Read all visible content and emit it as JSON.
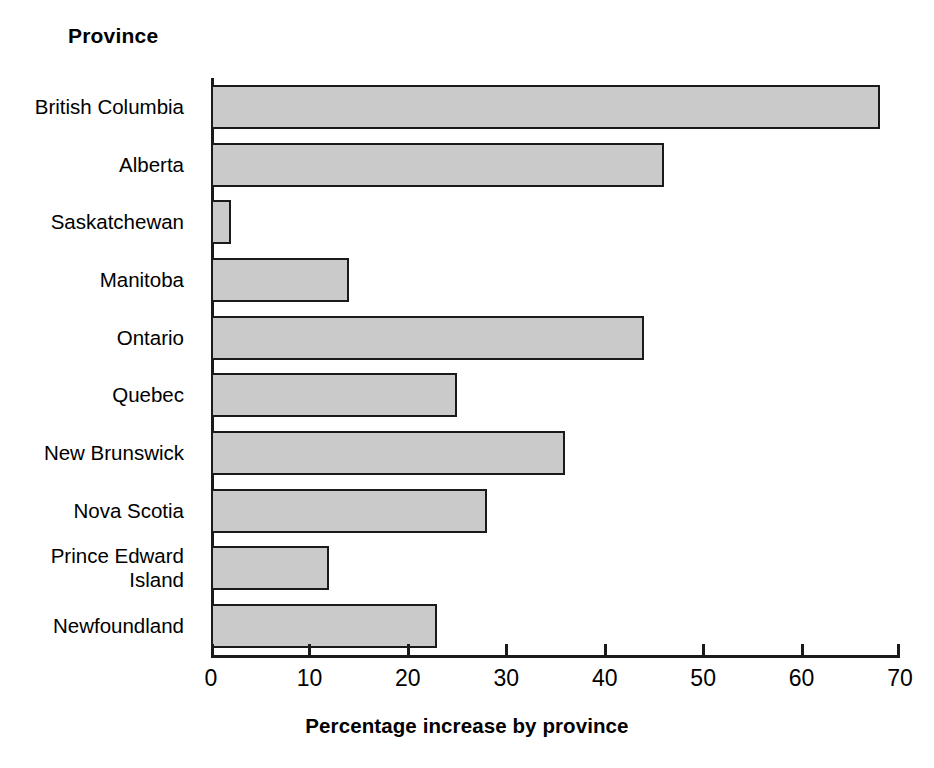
{
  "chart_data": {
    "type": "bar",
    "orientation": "horizontal",
    "title": "",
    "ylabel": "Province",
    "xlabel": "Percentage increase by province",
    "categories": [
      "British Columbia",
      "Alberta",
      "Saskatchewan",
      "Manitoba",
      "Ontario",
      "Quebec",
      "New Brunswick",
      "Nova Scotia",
      "Prince Edward\nIsland",
      "Newfoundland"
    ],
    "values": [
      68,
      46,
      2,
      14,
      44,
      25,
      36,
      28,
      12,
      23
    ],
    "xlim": [
      0,
      70
    ],
    "xticks": [
      0,
      10,
      20,
      30,
      40,
      50,
      60,
      70
    ],
    "xtick_labels": [
      "0",
      "10",
      "20",
      "30",
      "40",
      "50",
      "60",
      "70"
    ],
    "grid": false,
    "legend": false,
    "bar_fill_color": "#cacaca",
    "bar_edge_color": "#1a1a1a",
    "axis_color": "#1a1a1a",
    "background_color": "#ffffff"
  }
}
